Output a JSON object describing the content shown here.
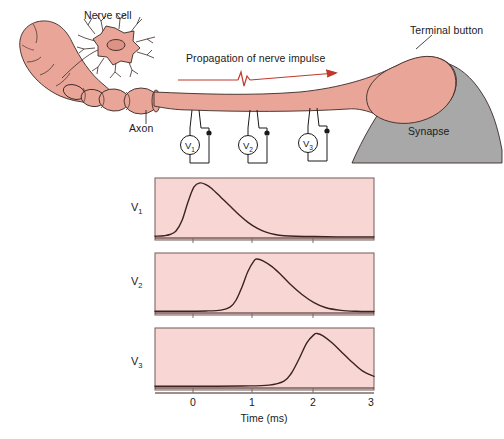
{
  "figure": {
    "labels": {
      "nerve_cell": "Nerve cell",
      "axon": "Axon",
      "propagation": "Propagation of nerve impulse",
      "terminal_button": "Terminal button",
      "synapse": "Synapse"
    },
    "meters": [
      {
        "name": "V",
        "sub": "1"
      },
      {
        "name": "V",
        "sub": "2"
      },
      {
        "name": "V",
        "sub": "3"
      }
    ],
    "colors": {
      "neuron_fill": "#e8a598",
      "neuron_stroke": "#3a2a26",
      "panel_fill": "#f7d6d4",
      "panel_stroke": "#7d6a66",
      "synapse_fill": "#a8a8a8",
      "arrow_red": "#c0392b",
      "trace_stroke": "#3a2320"
    }
  },
  "chart_data": [
    {
      "type": "line",
      "title": "V1 membrane potential recording",
      "row_label": "V",
      "row_label_sub": "1",
      "xlabel": "Time (ms)",
      "ylabel": "",
      "xlim": [
        -0.65,
        3.0
      ],
      "ylim": [
        0,
        1
      ],
      "xticks": [
        0,
        1,
        2,
        3
      ],
      "xticklabels": [
        "0",
        "1",
        "2",
        "3"
      ],
      "grid": false,
      "peak_time_ms": 0.1,
      "x": [
        -0.65,
        -0.5,
        -0.4,
        -0.3,
        -0.2,
        -0.1,
        0.0,
        0.1,
        0.2,
        0.3,
        0.45,
        0.6,
        0.75,
        0.9,
        1.05,
        1.2,
        1.35,
        1.5,
        1.7,
        2.0,
        2.4,
        3.0
      ],
      "y": [
        0.03,
        0.04,
        0.06,
        0.12,
        0.3,
        0.62,
        0.88,
        0.95,
        0.92,
        0.85,
        0.7,
        0.55,
        0.4,
        0.27,
        0.17,
        0.1,
        0.06,
        0.04,
        0.03,
        0.025,
        0.02,
        0.02
      ]
    },
    {
      "type": "line",
      "title": "V2 membrane potential recording",
      "row_label": "V",
      "row_label_sub": "2",
      "xlabel": "Time (ms)",
      "ylabel": "",
      "xlim": [
        -0.65,
        3.0
      ],
      "ylim": [
        0,
        1
      ],
      "xticks": [
        0,
        1,
        2,
        3
      ],
      "xticklabels": [
        "0",
        "1",
        "2",
        "3"
      ],
      "grid": false,
      "peak_time_ms": 1.05,
      "x": [
        -0.65,
        -0.2,
        0.2,
        0.45,
        0.6,
        0.7,
        0.8,
        0.9,
        1.0,
        1.05,
        1.15,
        1.3,
        1.45,
        1.6,
        1.8,
        2.0,
        2.2,
        2.45,
        2.7,
        3.0
      ],
      "y": [
        0.03,
        0.03,
        0.035,
        0.05,
        0.1,
        0.22,
        0.45,
        0.72,
        0.9,
        0.93,
        0.9,
        0.8,
        0.66,
        0.5,
        0.32,
        0.18,
        0.09,
        0.045,
        0.03,
        0.025
      ]
    },
    {
      "type": "line",
      "title": "V3 membrane potential recording",
      "row_label": "V",
      "row_label_sub": "3",
      "xlabel": "Time (ms)",
      "ylabel": "",
      "xlim": [
        -0.65,
        3.0
      ],
      "ylim": [
        0,
        1
      ],
      "xticks": [
        0,
        1,
        2,
        3
      ],
      "xticklabels": [
        "0",
        "1",
        "2",
        "3"
      ],
      "grid": false,
      "peak_time_ms": 2.05,
      "x": [
        -0.65,
        0.0,
        0.8,
        1.25,
        1.5,
        1.62,
        1.75,
        1.88,
        2.0,
        2.05,
        2.15,
        2.3,
        2.45,
        2.6,
        2.8,
        3.0
      ],
      "y": [
        0.03,
        0.03,
        0.035,
        0.05,
        0.12,
        0.25,
        0.5,
        0.78,
        0.92,
        0.94,
        0.9,
        0.78,
        0.63,
        0.48,
        0.3,
        0.2
      ]
    }
  ]
}
